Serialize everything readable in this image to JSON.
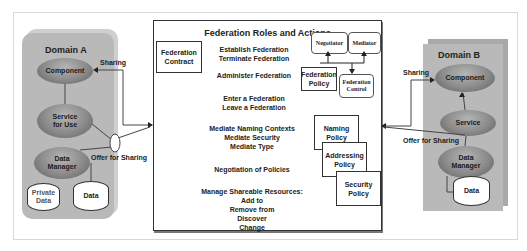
{
  "domain_a": {
    "title": "Domain A",
    "component": "Component",
    "service": "Service for Use",
    "data_manager": "Data Manager",
    "private_data": "Private Data",
    "data": "Data",
    "sharing_label": "Sharing",
    "offer_label": "Offer for Sharing"
  },
  "center": {
    "title": "Federation Roles and Actions",
    "federation_contract": "Federation Contract",
    "actions": [
      "Establish Federation\nTerminate Federation",
      "Administer Federation",
      "Enter a Federation\nLeave a Federation",
      "Mediate Naming Contexts\nMediate Security\nMediate Type",
      "Negotiation of Policies",
      "Manage Shareable Resources:\nAdd to\nRemove from\nDiscover\nChange"
    ],
    "roles": {
      "negotiator": "Negotiator",
      "mediator": "Mediator",
      "federation_policy": "Federation Policy",
      "federation_control": "Federation Control"
    },
    "policies": [
      "Naming Policy",
      "Addressing Policy",
      "Security Policy"
    ]
  },
  "domain_b": {
    "title": "Domain B",
    "component": "Component",
    "service": "Service",
    "data_manager": "Data Manager",
    "data": "Data",
    "sharing_label": "Sharing",
    "offer_label": "Offer for Sharing"
  }
}
